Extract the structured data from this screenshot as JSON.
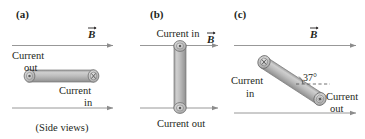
{
  "figure": {
    "caption": "(Side views)",
    "colors": {
      "line": "#8c8c8c",
      "text": "#231f20",
      "wire_fill": "#b3b3b3",
      "wire_edge": "#6e6e6e",
      "end_cap": "#c9c9c9",
      "background": "#ffffff"
    }
  },
  "panels": [
    {
      "id": "a",
      "label": "(a)",
      "field_label": "B",
      "field_direction": "right",
      "field_lines": 2,
      "wire_orientation": "horizontal",
      "wire_angle_deg": 0,
      "left_end": {
        "symbol": "dot",
        "meaning": "current-out"
      },
      "right_end": {
        "symbol": "cross",
        "meaning": "current-in"
      },
      "labels": [
        {
          "name": "current-out-label",
          "line1": "Current",
          "line2": "out"
        },
        {
          "name": "current-in-label",
          "line1": "Current",
          "line2": "in"
        }
      ],
      "caption": "(Side views)"
    },
    {
      "id": "b",
      "label": "(b)",
      "field_label": "B",
      "field_direction": "right",
      "field_lines": 2,
      "wire_orientation": "vertical",
      "wire_angle_deg": 90,
      "top_end": {
        "symbol": "dot",
        "meaning": "current-in"
      },
      "bottom_end": {
        "symbol": "dot",
        "meaning": "current-out"
      },
      "labels": [
        {
          "name": "current-in-label",
          "text": "Current in"
        },
        {
          "name": "current-out-label",
          "text": "Current out"
        }
      ]
    },
    {
      "id": "c",
      "label": "(c)",
      "field_label": "B",
      "field_direction": "right",
      "field_lines": 2,
      "wire_orientation": "tilted",
      "wire_angle_deg": 37,
      "angle_label": "37°",
      "upper_end": {
        "symbol": "cross",
        "meaning": "current-in"
      },
      "lower_end": {
        "symbol": "dot",
        "meaning": "current-out"
      },
      "labels": [
        {
          "name": "current-in-label",
          "line1": "Current",
          "line2": "in"
        },
        {
          "name": "current-out-label",
          "line1": "Current",
          "line2": "out"
        }
      ]
    }
  ]
}
